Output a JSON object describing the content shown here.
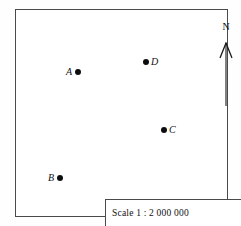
{
  "map": {
    "background_color": "#ffffff",
    "frame_color": "#4a4a4a",
    "points": [
      {
        "id": "A",
        "label": "A",
        "label_side": "left",
        "x": 71,
        "y": 70
      },
      {
        "id": "D",
        "label": "D",
        "label_side": "right",
        "x": 145,
        "y": 60
      },
      {
        "id": "C",
        "label": "C",
        "label_side": "right",
        "x": 163,
        "y": 128
      },
      {
        "id": "B",
        "label": "B",
        "label_side": "left",
        "x": 53,
        "y": 176
      }
    ],
    "north_arrow": {
      "label": "N"
    },
    "scale": {
      "text": "Scale   1 : 2 000 000",
      "label": "Scale",
      "ratio": "1 : 2 000 000"
    }
  }
}
